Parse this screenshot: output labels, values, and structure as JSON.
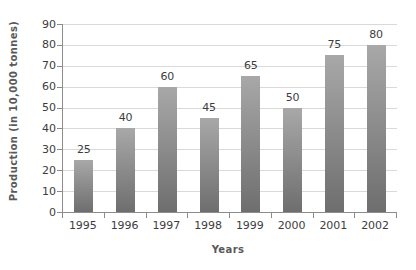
{
  "chart_data": {
    "type": "bar",
    "categories": [
      "1995",
      "1996",
      "1997",
      "1998",
      "1999",
      "2000",
      "2001",
      "2002"
    ],
    "values": [
      25,
      40,
      60,
      45,
      65,
      50,
      75,
      80
    ],
    "title": "",
    "xlabel": "Years",
    "ylabel": "Production (in 10,000 tonnes)",
    "ylim": [
      0,
      90
    ],
    "ytick_step": 10,
    "grid": true,
    "legend": "none",
    "data_labels": true,
    "colors": {
      "bar_gradient_top": "#a8a8a8",
      "bar_gradient_bottom": "#6e6e6e",
      "gridline": "#d9d9d9",
      "axis_line": "#8c8c8c",
      "tick_label": "#3d3d3d",
      "axis_title": "#595959",
      "background": "#ffffff"
    }
  }
}
